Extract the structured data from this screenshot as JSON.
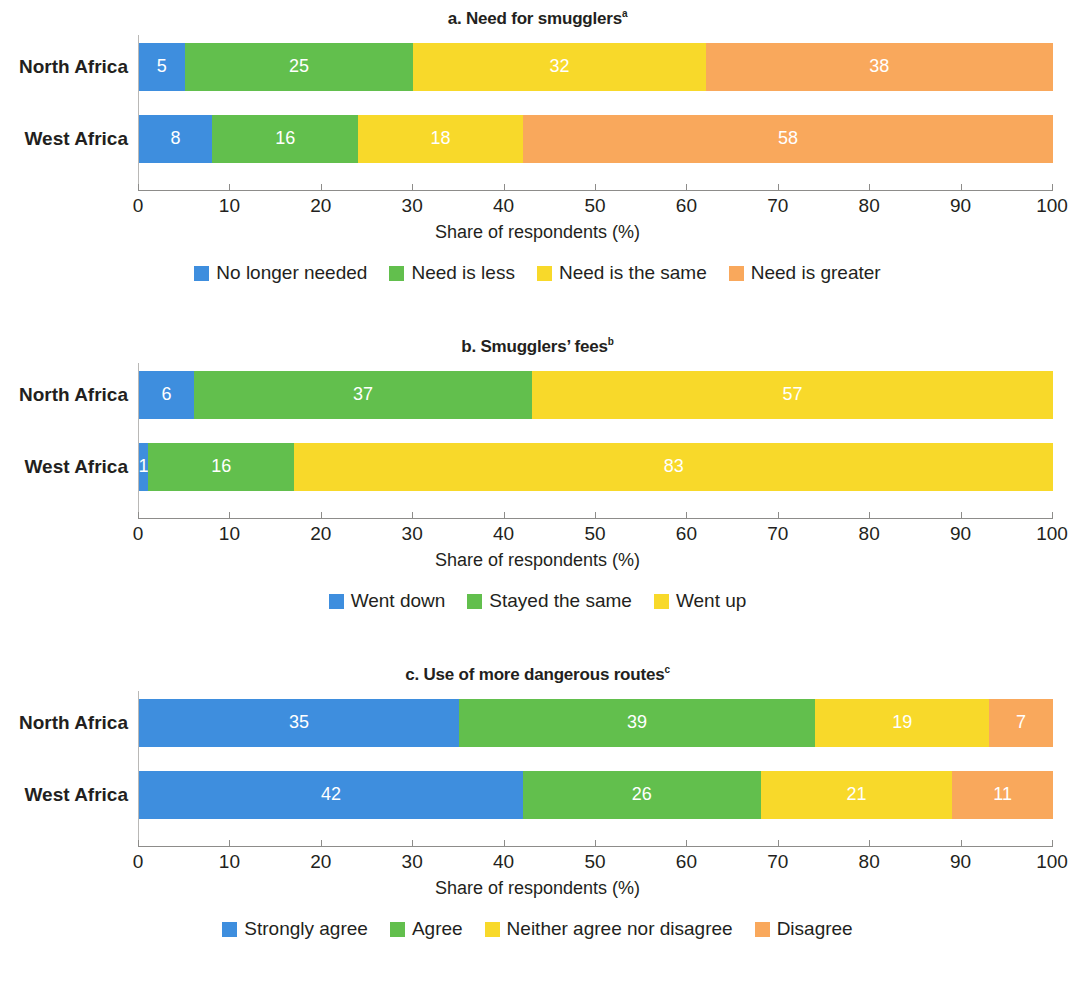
{
  "colors": {
    "blue": "#3e8ede",
    "green": "#62bf4d",
    "yellow": "#f8d92a",
    "orange": "#f9a85c",
    "axis": "#8d8c8a",
    "text": "#231f20"
  },
  "axis": {
    "label": "Share of respondents (%)",
    "ticks": [
      "0",
      "10",
      "20",
      "30",
      "40",
      "50",
      "60",
      "70",
      "80",
      "90",
      "100"
    ],
    "min": 0,
    "max": 100
  },
  "panels": [
    {
      "id": "a",
      "title": "a. Need for smugglers",
      "title_sup": "a",
      "categories": [
        "North Africa",
        "West Africa"
      ],
      "legend": [
        {
          "label": "No longer needed",
          "color": "#3e8ede"
        },
        {
          "label": "Need is less",
          "color": "#62bf4d"
        },
        {
          "label": "Need is the same",
          "color": "#f8d92a"
        },
        {
          "label": "Need is greater",
          "color": "#f9a85c"
        }
      ],
      "rows": [
        {
          "category": "North Africa",
          "values": [
            5,
            25,
            32,
            38
          ]
        },
        {
          "category": "West Africa",
          "values": [
            8,
            16,
            18,
            58
          ]
        }
      ]
    },
    {
      "id": "b",
      "title": "b. Smugglers’ fees",
      "title_sup": "b",
      "categories": [
        "North Africa",
        "West Africa"
      ],
      "legend": [
        {
          "label": "Went down",
          "color": "#3e8ede"
        },
        {
          "label": "Stayed the same",
          "color": "#62bf4d"
        },
        {
          "label": "Went up",
          "color": "#f8d92a"
        }
      ],
      "rows": [
        {
          "category": "North Africa",
          "values": [
            6,
            37,
            57
          ]
        },
        {
          "category": "West Africa",
          "values": [
            1,
            16,
            83
          ]
        }
      ]
    },
    {
      "id": "c",
      "title": "c. Use of more dangerous routes",
      "title_sup": "c",
      "categories": [
        "North Africa",
        "West Africa"
      ],
      "legend": [
        {
          "label": "Strongly agree",
          "color": "#3e8ede"
        },
        {
          "label": "Agree",
          "color": "#62bf4d"
        },
        {
          "label": "Neither agree nor disagree",
          "color": "#f8d92a"
        },
        {
          "label": "Disagree",
          "color": "#f9a85c"
        }
      ],
      "rows": [
        {
          "category": "North Africa",
          "values": [
            35,
            39,
            19,
            7
          ]
        },
        {
          "category": "West Africa",
          "values": [
            42,
            26,
            21,
            11
          ]
        }
      ]
    }
  ],
  "chart_data": {
    "type": "bar",
    "subtype": "stacked-horizontal-100",
    "xlabel": "Share of respondents (%)",
    "ylabel": "",
    "xlim": [
      0,
      100
    ],
    "grid": false,
    "legend_position": "bottom",
    "panels": [
      {
        "panel": "a",
        "title": "a. Need for smugglers",
        "categories": [
          "North Africa",
          "West Africa"
        ],
        "series": [
          {
            "name": "No longer needed",
            "color": "#3e8ede",
            "values": [
              5,
              8
            ]
          },
          {
            "name": "Need is less",
            "color": "#62bf4d",
            "values": [
              25,
              16
            ]
          },
          {
            "name": "Need is the same",
            "color": "#f8d92a",
            "values": [
              32,
              18
            ]
          },
          {
            "name": "Need is greater",
            "color": "#f9a85c",
            "values": [
              38,
              58
            ]
          }
        ]
      },
      {
        "panel": "b",
        "title": "b. Smugglers’ fees",
        "categories": [
          "North Africa",
          "West Africa"
        ],
        "series": [
          {
            "name": "Went down",
            "color": "#3e8ede",
            "values": [
              6,
              1
            ]
          },
          {
            "name": "Stayed the same",
            "color": "#62bf4d",
            "values": [
              37,
              16
            ]
          },
          {
            "name": "Went up",
            "color": "#f8d92a",
            "values": [
              57,
              83
            ]
          }
        ]
      },
      {
        "panel": "c",
        "title": "c. Use of more dangerous routes",
        "categories": [
          "North Africa",
          "West Africa"
        ],
        "series": [
          {
            "name": "Strongly agree",
            "color": "#3e8ede",
            "values": [
              35,
              42
            ]
          },
          {
            "name": "Agree",
            "color": "#62bf4d",
            "values": [
              39,
              26
            ]
          },
          {
            "name": "Neither agree nor disagree",
            "color": "#f8d92a",
            "values": [
              19,
              21
            ]
          },
          {
            "name": "Disagree",
            "color": "#f9a85c",
            "values": [
              7,
              11
            ]
          }
        ]
      }
    ]
  }
}
